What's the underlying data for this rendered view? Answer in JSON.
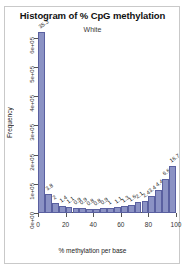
{
  "chart_data": {
    "type": "bar",
    "title": "Histogram of % CpG methylation",
    "subtitle": "White",
    "xlabel": "% methylation per base",
    "ylabel": "Frequency",
    "xlim": [
      0,
      100
    ],
    "ylim": [
      0,
      620000
    ],
    "grid": false,
    "legend": false,
    "bin_width": 5,
    "bar_color": "#8b92c4",
    "bar_border_color": "#5a60a0",
    "categories": [
      "0-5",
      "5-10",
      "10-15",
      "15-20",
      "20-25",
      "25-30",
      "30-35",
      "35-40",
      "40-45",
      "45-50",
      "50-55",
      "55-60",
      "60-65",
      "65-70",
      "70-75",
      "75-80",
      "80-85",
      "85-90",
      "90-95",
      "95-100"
    ],
    "x_centers": [
      2.5,
      7.5,
      12.5,
      17.5,
      22.5,
      27.5,
      32.5,
      37.5,
      42.5,
      47.5,
      52.5,
      57.5,
      62.5,
      67.5,
      72.5,
      77.5,
      82.5,
      87.5,
      92.5,
      97.5
    ],
    "percent_labels": [
      "35.3",
      "3.8",
      "2",
      "1.4",
      "1.1",
      "0.9",
      "0.9",
      "0.8",
      "0.8",
      "0.9",
      "1",
      "1.1",
      "1.3",
      "1.6",
      "2.1",
      "2.4",
      "3.4",
      "4.4",
      "6.6",
      "9.1"
    ],
    "values": [
      620000,
      66800,
      35200,
      24600,
      19300,
      15800,
      15800,
      14100,
      14100,
      15800,
      17600,
      19300,
      22900,
      28100,
      36900,
      42200,
      59700,
      77300,
      116000,
      160000
    ],
    "last_bar_label": "16.7",
    "yticks": [
      0,
      100000,
      200000,
      300000,
      400000,
      500000,
      600000
    ],
    "ytick_labels": [
      "0e+00",
      "1e+05",
      "2e+05",
      "3e+05",
      "4e+05",
      "5e+05",
      "6e+05"
    ],
    "xticks": [
      0,
      20,
      40,
      60,
      80,
      100
    ],
    "xtick_labels": [
      "0",
      "20",
      "40",
      "60",
      "80",
      "100"
    ]
  }
}
